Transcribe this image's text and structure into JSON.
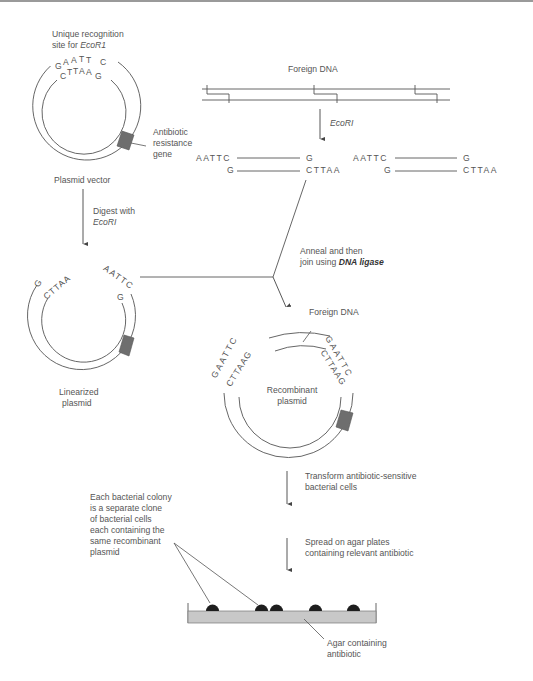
{
  "diagram": {
    "plasmid_vector": {
      "recognition_label_line1": "Unique recognition",
      "recognition_label_line2_prefix": "site for ",
      "recognition_label_enzyme": "EcoR1",
      "top_strand": "GAATTC",
      "bottom_strand": "CTTAAG",
      "gene_label_line1": "Antibiotic",
      "gene_label_line2": "resistance",
      "gene_label_line3": "gene",
      "caption": "Plasmid vector"
    },
    "digest_step": {
      "line1": "Digest with",
      "enzyme": "EcoRI"
    },
    "linearized_plasmid": {
      "left_end_outer": "G",
      "left_end_inner": "CTTAA",
      "right_end_outer": "AATTC",
      "right_end_inner": "G",
      "caption_line1": "Linearized",
      "caption_line2": "plasmid"
    },
    "foreign_dna": {
      "label": "Foreign DNA",
      "enzyme": "EcoRI",
      "fragments": [
        {
          "top_left": "AATTC",
          "top_right": "G",
          "bottom_left": "G",
          "bottom_right": "CTTAA"
        },
        {
          "top_left": "AATTC",
          "top_right": "G",
          "bottom_left": "G",
          "bottom_right": "CTTAA"
        }
      ]
    },
    "anneal_step": {
      "line1": "Anneal and then",
      "line2_prefix": "join using ",
      "enzyme": "DNA ligase"
    },
    "recombinant_plasmid": {
      "insert_label": "Foreign DNA",
      "left_outer": "GAATTC",
      "left_inner": "CTTAAG",
      "right_outer": "GAATTC",
      "right_inner": "CTTAAG",
      "caption_line1": "Recombinant",
      "caption_line2": "plasmid"
    },
    "transform_step": {
      "line1": "Transform antibiotic-sensitive",
      "line2": "bacterial cells"
    },
    "spread_step": {
      "line1": "Spread on agar plates",
      "line2": "containing relevant antibiotic"
    },
    "colony_note": {
      "line1": "Each bacterial colony",
      "line2": "is a separate clone",
      "line3": "of bacterial cells",
      "line4": "each containing the",
      "line5": "same recombinant",
      "line6": "plasmid"
    },
    "agar": {
      "label_line1": "Agar containing",
      "label_line2": "antibiotic",
      "colony_count": 5
    },
    "colors": {
      "line": "#555555",
      "gene_fill": "#6e6e6e",
      "agar_fill": "#c8c8c8",
      "colony_fill": "#1e1e1e"
    }
  }
}
